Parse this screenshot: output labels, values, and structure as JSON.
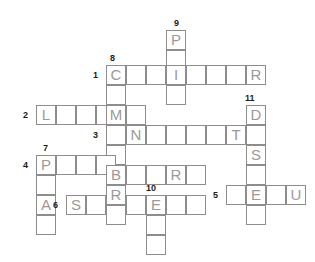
{
  "puzzle": {
    "title": "crossword-grid",
    "cell_size": 20,
    "grid_color": "#8d8d8d",
    "letter_color": "#9a9a9a",
    "clue_color": "#1b1b1b",
    "background": "#ffffff",
    "clue_numbers": [
      {
        "number": "9",
        "x": 174,
        "y": 18
      },
      {
        "number": "8",
        "x": 110,
        "y": 53
      },
      {
        "number": "1",
        "x": 93,
        "y": 70
      },
      {
        "number": "11",
        "x": 245,
        "y": 93
      },
      {
        "number": "2",
        "x": 23,
        "y": 110
      },
      {
        "number": "3",
        "x": 93,
        "y": 130
      },
      {
        "number": "7",
        "x": 43,
        "y": 143
      },
      {
        "number": "4",
        "x": 23,
        "y": 160
      },
      {
        "number": "10",
        "x": 146,
        "y": 183
      },
      {
        "number": "5",
        "x": 213,
        "y": 190
      },
      {
        "number": "6",
        "x": 53,
        "y": 200
      }
    ],
    "cells": [
      {
        "x": 166,
        "y": 30,
        "letter": "P"
      },
      {
        "x": 166,
        "y": 50,
        "letter": ""
      },
      {
        "x": 106,
        "y": 65,
        "letter": "C"
      },
      {
        "x": 126,
        "y": 65,
        "letter": ""
      },
      {
        "x": 146,
        "y": 65,
        "letter": ""
      },
      {
        "x": 166,
        "y": 65,
        "letter": "I"
      },
      {
        "x": 186,
        "y": 65,
        "letter": ""
      },
      {
        "x": 206,
        "y": 65,
        "letter": ""
      },
      {
        "x": 226,
        "y": 65,
        "letter": ""
      },
      {
        "x": 246,
        "y": 65,
        "letter": "R"
      },
      {
        "x": 106,
        "y": 85,
        "letter": ""
      },
      {
        "x": 166,
        "y": 85,
        "letter": ""
      },
      {
        "x": 36,
        "y": 105,
        "letter": "L"
      },
      {
        "x": 56,
        "y": 105,
        "letter": ""
      },
      {
        "x": 76,
        "y": 105,
        "letter": ""
      },
      {
        "x": 96,
        "y": 105,
        "letter": ""
      },
      {
        "x": 106,
        "y": 105,
        "letter": "M"
      },
      {
        "x": 126,
        "y": 105,
        "letter": ""
      },
      {
        "x": 246,
        "y": 105,
        "letter": "D"
      },
      {
        "x": 106,
        "y": 125,
        "letter": ""
      },
      {
        "x": 126,
        "y": 125,
        "letter": "N"
      },
      {
        "x": 146,
        "y": 125,
        "letter": ""
      },
      {
        "x": 166,
        "y": 125,
        "letter": ""
      },
      {
        "x": 186,
        "y": 125,
        "letter": ""
      },
      {
        "x": 206,
        "y": 125,
        "letter": ""
      },
      {
        "x": 226,
        "y": 125,
        "letter": "T"
      },
      {
        "x": 246,
        "y": 125,
        "letter": ""
      },
      {
        "x": 106,
        "y": 145,
        "letter": ""
      },
      {
        "x": 246,
        "y": 145,
        "letter": "S"
      },
      {
        "x": 36,
        "y": 155,
        "letter": "P"
      },
      {
        "x": 56,
        "y": 155,
        "letter": ""
      },
      {
        "x": 76,
        "y": 155,
        "letter": ""
      },
      {
        "x": 96,
        "y": 155,
        "letter": ""
      },
      {
        "x": 106,
        "y": 165,
        "letter": "B"
      },
      {
        "x": 126,
        "y": 165,
        "letter": ""
      },
      {
        "x": 146,
        "y": 165,
        "letter": ""
      },
      {
        "x": 166,
        "y": 165,
        "letter": "R"
      },
      {
        "x": 186,
        "y": 165,
        "letter": ""
      },
      {
        "x": 246,
        "y": 165,
        "letter": ""
      },
      {
        "x": 36,
        "y": 175,
        "letter": ""
      },
      {
        "x": 106,
        "y": 185,
        "letter": "R"
      },
      {
        "x": 226,
        "y": 185,
        "letter": ""
      },
      {
        "x": 246,
        "y": 185,
        "letter": "E"
      },
      {
        "x": 266,
        "y": 185,
        "letter": ""
      },
      {
        "x": 286,
        "y": 185,
        "letter": "U"
      },
      {
        "x": 36,
        "y": 195,
        "letter": "A"
      },
      {
        "x": 66,
        "y": 195,
        "letter": "S"
      },
      {
        "x": 86,
        "y": 195,
        "letter": ""
      },
      {
        "x": 126,
        "y": 195,
        "letter": ""
      },
      {
        "x": 146,
        "y": 195,
        "letter": "E"
      },
      {
        "x": 166,
        "y": 195,
        "letter": ""
      },
      {
        "x": 186,
        "y": 195,
        "letter": ""
      },
      {
        "x": 36,
        "y": 215,
        "letter": ""
      },
      {
        "x": 106,
        "y": 205,
        "letter": ""
      },
      {
        "x": 146,
        "y": 215,
        "letter": ""
      },
      {
        "x": 246,
        "y": 205,
        "letter": ""
      },
      {
        "x": 146,
        "y": 235,
        "letter": ""
      }
    ]
  }
}
